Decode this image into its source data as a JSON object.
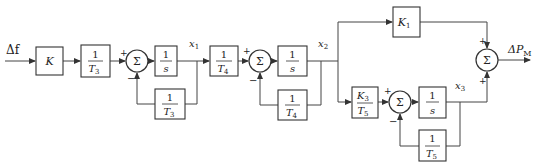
{
  "diagram": {
    "type": "block-diagram",
    "input": {
      "label": "Δf"
    },
    "output": {
      "label": "ΔP",
      "subscript": "M"
    },
    "blocks": [
      {
        "id": "gain-k",
        "type": "gain",
        "label": "K"
      },
      {
        "id": "inv-t3",
        "num": "1",
        "den": "T",
        "den_sub": "3"
      },
      {
        "id": "integrator-1",
        "num": "1",
        "den": "s"
      },
      {
        "id": "feedback-inv-t3",
        "num": "1",
        "den": "T",
        "den_sub": "3"
      },
      {
        "id": "inv-t4",
        "num": "1",
        "den": "T",
        "den_sub": "4"
      },
      {
        "id": "integrator-2",
        "num": "1",
        "den": "s"
      },
      {
        "id": "feedback-inv-t4",
        "num": "1",
        "den": "T",
        "den_sub": "4"
      },
      {
        "id": "gain-k1",
        "type": "gain",
        "label": "K",
        "label_sub": "1"
      },
      {
        "id": "k3-over-t5",
        "num": "K",
        "num_sub": "3",
        "den": "T",
        "den_sub": "5"
      },
      {
        "id": "integrator-3",
        "num": "1",
        "den": "s"
      },
      {
        "id": "feedback-inv-t5",
        "num": "1",
        "den": "T",
        "den_sub": "5"
      }
    ],
    "summing_junctions": [
      {
        "id": "sum-1",
        "symbol": "Σ",
        "signs": [
          "+",
          "−"
        ]
      },
      {
        "id": "sum-2",
        "symbol": "Σ",
        "signs": [
          "+",
          "−"
        ]
      },
      {
        "id": "sum-3",
        "symbol": "Σ",
        "signs": [
          "+",
          "−"
        ]
      },
      {
        "id": "sum-4",
        "symbol": "Σ",
        "signs": [
          "+",
          "+"
        ]
      }
    ],
    "signals": [
      {
        "id": "x1",
        "label": "x",
        "sub": "1"
      },
      {
        "id": "x2",
        "label": "x",
        "sub": "2"
      },
      {
        "id": "x3",
        "label": "x",
        "sub": "3"
      }
    ]
  }
}
